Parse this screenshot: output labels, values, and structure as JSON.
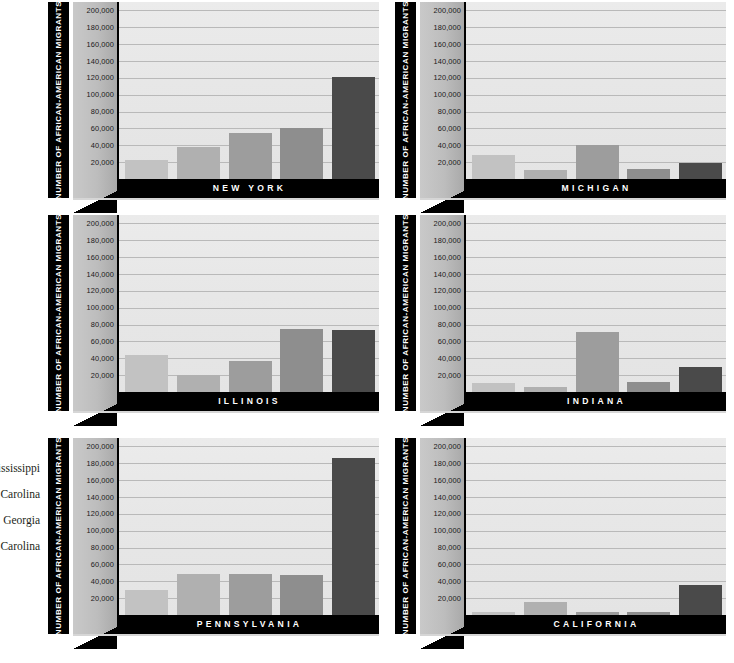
{
  "margin_notes": [
    "Mississippi",
    "South Carolina",
    "Georgia",
    "North Carolina"
  ],
  "axis": {
    "y_title": "NUMBER OF AFRICAN-AMERICAN MIGRANTS",
    "ticks": [
      "200,000",
      "180,000",
      "160,000",
      "140,000",
      "120,000",
      "100,000",
      "80,000",
      "60,000",
      "40,000",
      "20,000"
    ]
  },
  "palette": {
    "series_1": "#c2c2c2",
    "series_2": "#b0b0b0",
    "series_3": "#9d9d9d",
    "series_4": "#8e8e8e",
    "series_5": "#4a4a4a",
    "panel_bg": "#e7e7e7",
    "band_bg": "#000000",
    "gridline": "#b9b9b9"
  },
  "chart_data": [
    {
      "type": "bar",
      "title": "NEW YORK",
      "ylabel": "NUMBER OF AFRICAN-AMERICAN MIGRANTS",
      "xlabel": "",
      "ylim": [
        0,
        210000
      ],
      "ytick_step": 20000,
      "grid": true,
      "legend": "none",
      "categories": [
        "Mississippi",
        "South Carolina",
        "Georgia",
        "North Carolina",
        "Total"
      ],
      "values": [
        22000,
        38000,
        55000,
        61000,
        121000
      ]
    },
    {
      "type": "bar",
      "title": "MICHIGAN",
      "ylabel": "NUMBER OF AFRICAN-AMERICAN MIGRANTS",
      "xlabel": "",
      "ylim": [
        0,
        210000
      ],
      "ytick_step": 20000,
      "grid": true,
      "legend": "none",
      "categories": [
        "Mississippi",
        "South Carolina",
        "Georgia",
        "North Carolina",
        "Total"
      ],
      "values": [
        29000,
        11000,
        40000,
        12000,
        19000
      ]
    },
    {
      "type": "bar",
      "title": "ILLINOIS",
      "ylabel": "NUMBER OF AFRICAN-AMERICAN MIGRANTS",
      "xlabel": "",
      "ylim": [
        0,
        210000
      ],
      "ytick_step": 20000,
      "grid": true,
      "legend": "none",
      "categories": [
        "Mississippi",
        "South Carolina",
        "Georgia",
        "North Carolina",
        "Total"
      ],
      "values": [
        44000,
        20000,
        37000,
        75000,
        73000
      ]
    },
    {
      "type": "bar",
      "title": "INDIANA",
      "ylabel": "NUMBER OF AFRICAN-AMERICAN MIGRANTS",
      "xlabel": "",
      "ylim": [
        0,
        210000
      ],
      "ytick_step": 20000,
      "grid": true,
      "legend": "none",
      "categories": [
        "Mississippi",
        "South Carolina",
        "Georgia",
        "North Carolina",
        "Total"
      ],
      "values": [
        11000,
        6000,
        71000,
        12000,
        30000
      ]
    },
    {
      "type": "bar",
      "title": "PENNSYLVANIA",
      "ylabel": "NUMBER OF AFRICAN-AMERICAN MIGRANTS",
      "xlabel": "",
      "ylim": [
        0,
        210000
      ],
      "ytick_step": 20000,
      "grid": true,
      "legend": "none",
      "categories": [
        "Mississippi",
        "South Carolina",
        "Georgia",
        "North Carolina",
        "Total"
      ],
      "values": [
        30000,
        49000,
        49000,
        47000,
        186000
      ]
    },
    {
      "type": "bar",
      "title": "CALIFORNIA",
      "ylabel": "NUMBER OF AFRICAN-AMERICAN MIGRANTS",
      "xlabel": "",
      "ylim": [
        0,
        210000
      ],
      "ytick_step": 20000,
      "grid": true,
      "legend": "none",
      "categories": [
        "Mississippi",
        "South Carolina",
        "Georgia",
        "North Carolina",
        "Total"
      ],
      "values": [
        4000,
        15000,
        4000,
        4000,
        36000
      ]
    }
  ]
}
